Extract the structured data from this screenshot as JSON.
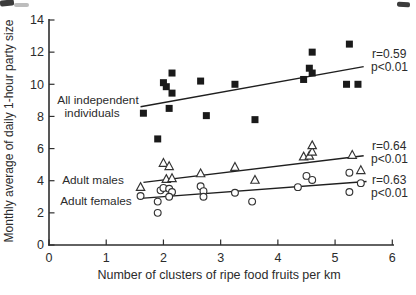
{
  "chart_data": {
    "type": "scatter",
    "title": "",
    "xlabel": "Number of clusters of ripe food fruits per km",
    "ylabel": "Monthly average of daily 1-hour party size",
    "xlim": [
      0,
      6
    ],
    "ylim": [
      0,
      14
    ],
    "x_ticks": [
      "0",
      "1",
      "2",
      "3",
      "4",
      "5",
      "6"
    ],
    "y_ticks": [
      "0",
      "2",
      "4",
      "6",
      "8",
      "10",
      "12",
      "14"
    ],
    "grid": false,
    "legend_position": "inline-labels",
    "colors": {
      "marker": "#1a1a1a",
      "axis": "#2e2e2e",
      "text": "#2b2b2b",
      "background": "#ffffff"
    },
    "series": [
      {
        "name": "All independent individuals",
        "marker": "filled-square",
        "label_lines": [
          "All independent",
          "individuals"
        ],
        "points": [
          [
            1.65,
            8.2
          ],
          [
            1.9,
            6.6
          ],
          [
            2.0,
            10.1
          ],
          [
            2.05,
            9.85
          ],
          [
            2.15,
            10.7
          ],
          [
            2.15,
            9.45
          ],
          [
            2.1,
            8.5
          ],
          [
            2.65,
            10.2
          ],
          [
            2.75,
            8.05
          ],
          [
            3.25,
            10.0
          ],
          [
            3.6,
            7.8
          ],
          [
            4.45,
            10.3
          ],
          [
            4.55,
            11.0
          ],
          [
            4.6,
            10.7
          ],
          [
            4.6,
            12.0
          ],
          [
            5.25,
            12.5
          ],
          [
            5.2,
            10.0
          ],
          [
            5.4,
            10.0
          ]
        ],
        "fit_line": [
          [
            1.6,
            8.6
          ],
          [
            5.5,
            11.1
          ]
        ],
        "stats": [
          "r=0.59",
          "p<0.01"
        ]
      },
      {
        "name": "Adult males",
        "marker": "open-triangle",
        "label_lines": [
          "Adult males"
        ],
        "points": [
          [
            1.6,
            3.6
          ],
          [
            2.0,
            5.1
          ],
          [
            2.1,
            4.9
          ],
          [
            2.05,
            4.1
          ],
          [
            2.15,
            4.15
          ],
          [
            2.65,
            4.45
          ],
          [
            3.25,
            4.85
          ],
          [
            3.6,
            4.05
          ],
          [
            4.45,
            5.5
          ],
          [
            4.55,
            5.55
          ],
          [
            4.6,
            5.8
          ],
          [
            4.6,
            6.2
          ],
          [
            5.3,
            5.6
          ],
          [
            5.45,
            4.65
          ]
        ],
        "fit_line": [
          [
            1.65,
            3.9
          ],
          [
            5.5,
            5.55
          ]
        ],
        "stats": [
          "r=0.64",
          "p<0.01"
        ]
      },
      {
        "name": "Adult females",
        "marker": "open-circle",
        "label_lines": [
          "Adult females"
        ],
        "points": [
          [
            1.6,
            3.05
          ],
          [
            1.9,
            2.7
          ],
          [
            1.9,
            2.0
          ],
          [
            1.95,
            3.4
          ],
          [
            2.0,
            3.55
          ],
          [
            2.1,
            3.5
          ],
          [
            2.15,
            3.3
          ],
          [
            2.1,
            3.0
          ],
          [
            2.65,
            3.65
          ],
          [
            2.7,
            3.35
          ],
          [
            2.7,
            3.0
          ],
          [
            3.25,
            3.25
          ],
          [
            3.55,
            2.7
          ],
          [
            4.35,
            3.6
          ],
          [
            4.5,
            4.3
          ],
          [
            4.6,
            4.05
          ],
          [
            5.25,
            4.5
          ],
          [
            5.25,
            3.3
          ],
          [
            5.45,
            3.85
          ]
        ],
        "fit_line": [
          [
            1.6,
            2.9
          ],
          [
            5.55,
            3.95
          ]
        ],
        "stats": [
          "r=0.63",
          "p<0.01"
        ]
      }
    ]
  }
}
